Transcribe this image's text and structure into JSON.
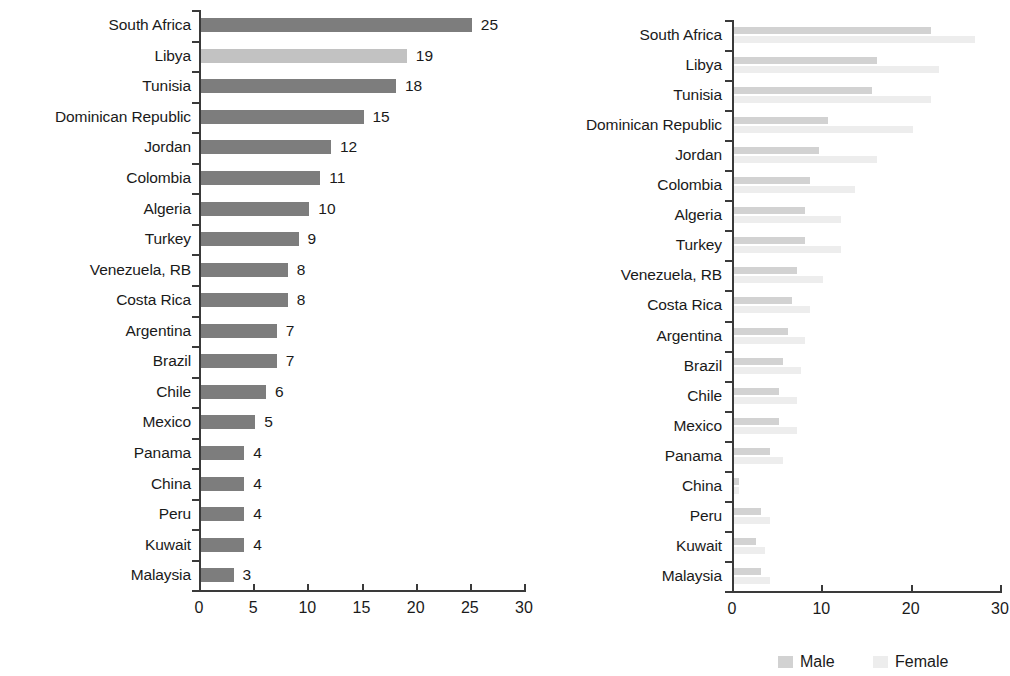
{
  "chart_data": [
    {
      "id": "left",
      "type": "bar",
      "orientation": "horizontal",
      "title": "",
      "xlabel": "",
      "ylabel": "",
      "xlim": [
        0,
        30
      ],
      "xticks": [
        0,
        5,
        10,
        15,
        20,
        25,
        30
      ],
      "xtick_labels": [
        "0",
        "5",
        "10",
        "15",
        "20",
        "25",
        "30"
      ],
      "grid": false,
      "legend": null,
      "data_labels": true,
      "categories": [
        "South Africa",
        "Libya",
        "Tunisia",
        "Dominican Republic",
        "Jordan",
        "Colombia",
        "Algeria",
        "Turkey",
        "Venezuela, RB",
        "Costa Rica",
        "Argentina",
        "Brazil",
        "Chile",
        "Mexico",
        "Panama",
        "China",
        "Peru",
        "Kuwait",
        "Malaysia"
      ],
      "values": [
        25,
        19,
        18,
        15,
        12,
        11,
        10,
        9,
        8,
        8,
        7,
        7,
        6,
        5,
        4,
        4,
        4,
        4,
        3
      ],
      "value_labels": [
        "25",
        "19",
        "18",
        "15",
        "12",
        "11",
        "10",
        "9",
        "8",
        "8",
        "7",
        "7",
        "6",
        "5",
        "4",
        "4",
        "4",
        "4",
        "3"
      ],
      "bar_colors": [
        "#7d7d7d",
        "#c2c2c2",
        "#7d7d7d",
        "#7d7d7d",
        "#7d7d7d",
        "#7d7d7d",
        "#7d7d7d",
        "#7d7d7d",
        "#7d7d7d",
        "#7d7d7d",
        "#7d7d7d",
        "#7d7d7d",
        "#7d7d7d",
        "#7d7d7d",
        "#7d7d7d",
        "#7d7d7d",
        "#7d7d7d",
        "#7d7d7d",
        "#7d7d7d"
      ]
    },
    {
      "id": "right",
      "type": "bar",
      "orientation": "horizontal",
      "title": "",
      "xlabel": "",
      "ylabel": "",
      "xlim": [
        0,
        30
      ],
      "xticks": [
        0,
        10,
        20,
        30
      ],
      "xtick_labels": [
        "0",
        "10",
        "20",
        "30"
      ],
      "grid": false,
      "legend_position": "bottom",
      "data_labels": false,
      "categories": [
        "South Africa",
        "Libya",
        "Tunisia",
        "Dominican Republic",
        "Jordan",
        "Colombia",
        "Algeria",
        "Turkey",
        "Venezuela, RB",
        "Costa Rica",
        "Argentina",
        "Brazil",
        "Chile",
        "Mexico",
        "Panama",
        "China",
        "Peru",
        "Kuwait",
        "Malaysia"
      ],
      "series": [
        {
          "name": "Male",
          "color": "#d2d2d2",
          "values": [
            22,
            16,
            15.5,
            10.5,
            9.5,
            8.5,
            8,
            8,
            7,
            6.5,
            6,
            5.5,
            5,
            5,
            4,
            0.6,
            3,
            2.5,
            3
          ]
        },
        {
          "name": "Female",
          "color": "#ededed",
          "values": [
            27,
            23,
            22,
            20,
            16,
            13.5,
            12,
            12,
            10,
            8.5,
            8,
            7.5,
            7,
            7,
            5.5,
            0.6,
            4,
            3.5,
            4
          ]
        }
      ]
    }
  ],
  "legend": {
    "male_label": "Male",
    "female_label": "Female",
    "male_color": "#d2d2d2",
    "female_color": "#ededed"
  },
  "colors": {
    "bar_default": "#7d7d7d",
    "bar_highlight": "#c2c2c2",
    "axis": "#3a3a3a",
    "text": "#1a1a1a",
    "background": "#ffffff"
  }
}
